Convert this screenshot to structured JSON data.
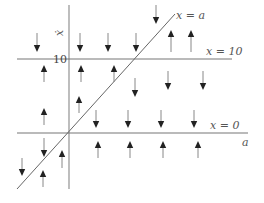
{
  "diagram": {
    "title": "",
    "colors": {
      "axis": "#777777",
      "line": "#666666",
      "arrow": "#222222",
      "arrow_shaft": "#888888",
      "background": "#ffffff"
    },
    "axes": {
      "horizontal_label": "a",
      "vertical_label": "ẋ",
      "tick_label_10": "10"
    },
    "lines": [
      {
        "id": "x-equals-a",
        "label": "x = a",
        "kind": "diagonal"
      },
      {
        "id": "x-equals-10",
        "label": "x = 10",
        "kind": "horizontal"
      },
      {
        "id": "x-equals-0",
        "label": "x = 0",
        "kind": "horizontal"
      }
    ],
    "arrows": [
      {
        "x": 37,
        "y1": 33,
        "y2": 52,
        "dir": "down"
      },
      {
        "x": 80,
        "y1": 33,
        "y2": 52,
        "dir": "down"
      },
      {
        "x": 108,
        "y1": 33,
        "y2": 52,
        "dir": "down"
      },
      {
        "x": 136,
        "y1": 33,
        "y2": 52,
        "dir": "down"
      },
      {
        "x": 156,
        "y1": 5,
        "y2": 24,
        "dir": "down"
      },
      {
        "x": 171,
        "y1": 30,
        "y2": 52,
        "dir": "up"
      },
      {
        "x": 191,
        "y1": 30,
        "y2": 52,
        "dir": "up"
      },
      {
        "x": 44,
        "y1": 65,
        "y2": 82,
        "dir": "up"
      },
      {
        "x": 81,
        "y1": 65,
        "y2": 82,
        "dir": "up"
      },
      {
        "x": 114,
        "y1": 65,
        "y2": 82,
        "dir": "up"
      },
      {
        "x": 168,
        "y1": 71,
        "y2": 90,
        "dir": "down"
      },
      {
        "x": 203,
        "y1": 71,
        "y2": 90,
        "dir": "down"
      },
      {
        "x": 135,
        "y1": 78,
        "y2": 97,
        "dir": "down"
      },
      {
        "x": 79,
        "y1": 96,
        "y2": 113,
        "dir": "up"
      },
      {
        "x": 44,
        "y1": 108,
        "y2": 125,
        "dir": "up"
      },
      {
        "x": 96,
        "y1": 110,
        "y2": 128,
        "dir": "down"
      },
      {
        "x": 128,
        "y1": 110,
        "y2": 128,
        "dir": "down"
      },
      {
        "x": 161,
        "y1": 110,
        "y2": 128,
        "dir": "down"
      },
      {
        "x": 194,
        "y1": 110,
        "y2": 128,
        "dir": "down"
      },
      {
        "x": 98,
        "y1": 141,
        "y2": 158,
        "dir": "up"
      },
      {
        "x": 130,
        "y1": 141,
        "y2": 158,
        "dir": "up"
      },
      {
        "x": 163,
        "y1": 141,
        "y2": 158,
        "dir": "up"
      },
      {
        "x": 198,
        "y1": 141,
        "y2": 158,
        "dir": "up"
      },
      {
        "x": 44,
        "y1": 138,
        "y2": 157,
        "dir": "down"
      },
      {
        "x": 62,
        "y1": 150,
        "y2": 168,
        "dir": "up"
      },
      {
        "x": 22,
        "y1": 158,
        "y2": 176,
        "dir": "down"
      },
      {
        "x": 43,
        "y1": 170,
        "y2": 187,
        "dir": "up"
      }
    ]
  }
}
